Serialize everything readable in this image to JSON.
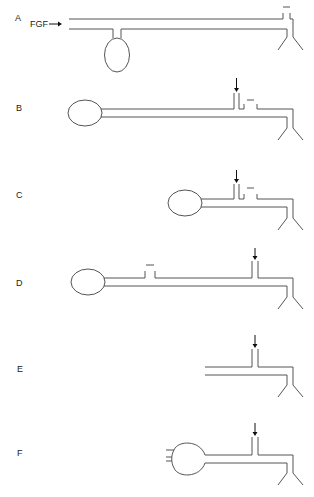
{
  "figure": {
    "panels": [
      {
        "label": "A",
        "name": "Mapleson A"
      },
      {
        "label": "B",
        "name": "Mapleson B"
      },
      {
        "label": "C",
        "name": "Mapleson C"
      },
      {
        "label": "D",
        "name": "Mapleson D"
      },
      {
        "label": "E",
        "name": "Mapleson E"
      },
      {
        "label": "F",
        "name": "Mapleson F"
      }
    ],
    "annotations": {
      "fgf_label": "FGF"
    },
    "colors": {
      "line": "#555555",
      "arrow": "#111111",
      "background": "#ffffff"
    }
  }
}
